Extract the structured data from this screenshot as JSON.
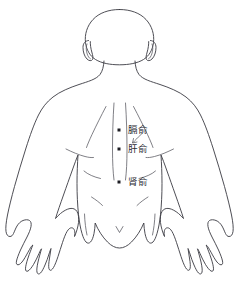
{
  "diagram": {
    "view": "posterior-back",
    "background_color": "#ffffff",
    "outline_color": "#3a3a42",
    "inner_line_color": "#55555e",
    "marker_color": "#1e1e24",
    "label_color": "#2b2b33"
  },
  "acupoints": [
    {
      "marker_name": "acupoint-marker-geshu",
      "label_name": "acupoint-label-geshu",
      "label": "膈俞",
      "marker_x": 119,
      "marker_y": 130,
      "label_x": 128,
      "label_y": 130,
      "has_leader_line": true
    },
    {
      "marker_name": "acupoint-marker-ganshu",
      "label_name": "acupoint-label-ganshu",
      "label": "肝俞",
      "marker_x": 119,
      "marker_y": 149,
      "label_x": 128,
      "label_y": 149,
      "has_leader_line": false
    },
    {
      "marker_name": "acupoint-marker-shenshu",
      "label_name": "acupoint-label-shenshu",
      "label": "肾俞",
      "marker_x": 119,
      "marker_y": 182,
      "label_x": 128,
      "label_y": 182,
      "has_leader_line": false
    }
  ]
}
